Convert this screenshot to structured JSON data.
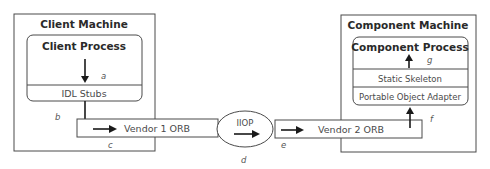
{
  "client_machine": {
    "title": "Client Machine",
    "process": {
      "title": "Client Process"
    },
    "stubs": {
      "label": "IDL Stubs"
    }
  },
  "component_machine": {
    "title": "Component Machine",
    "process": {
      "title": "Component Process"
    },
    "skeleton": {
      "label": "Static Skeleton"
    },
    "adapter": {
      "label": "Portable Object Adapter"
    }
  },
  "orbs": {
    "vendor1": {
      "label": "Vendor 1 ORB"
    },
    "vendor2": {
      "label": "Vendor 2 ORB"
    }
  },
  "protocol": {
    "label": "IIOP"
  },
  "step_labels": {
    "a": "a",
    "b": "b",
    "c": "c",
    "d": "d",
    "e": "e",
    "f": "f",
    "g": "g"
  }
}
